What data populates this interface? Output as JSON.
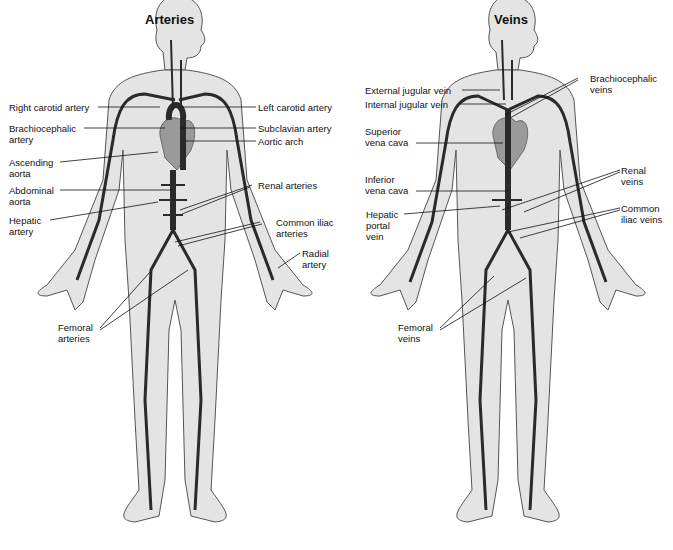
{
  "figure": {
    "panels": [
      {
        "title": "Arteries",
        "labels": [
          {
            "text": "Right carotid artery"
          },
          {
            "text": "Left carotid artery"
          },
          {
            "text": "Brachiocephalic\nartery"
          },
          {
            "text": "Subclavian artery"
          },
          {
            "text": "Aortic arch"
          },
          {
            "text": "Ascending\naorta"
          },
          {
            "text": "Abdominal\naorta"
          },
          {
            "text": "Renal arteries"
          },
          {
            "text": "Hepatic\nartery"
          },
          {
            "text": "Common iliac\narteries"
          },
          {
            "text": "Radial\nartery"
          },
          {
            "text": "Femoral\narteries"
          }
        ]
      },
      {
        "title": "Veins",
        "labels": [
          {
            "text": "External jugular vein"
          },
          {
            "text": "Internal jugular vein"
          },
          {
            "text": "Brachiocephalic\nveins"
          },
          {
            "text": "Superior\nvena cava"
          },
          {
            "text": "Inferior\nvena cava"
          },
          {
            "text": "Renal\nveins"
          },
          {
            "text": "Hepatic\nportal\nvein"
          },
          {
            "text": "Common\niliac veins"
          },
          {
            "text": "Femoral\nveins"
          }
        ]
      }
    ],
    "colors": {
      "body_fill": "#e4e4e4",
      "body_outline": "#555555",
      "vessel": "#2a2a2a",
      "heart": "#9a9a9a",
      "leader_line": "#111111"
    }
  }
}
